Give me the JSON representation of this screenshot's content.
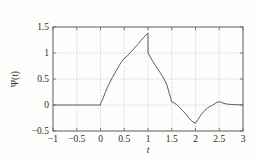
{
  "figure": {
    "background_color": "#fdfdfb",
    "frame_color": "#6b6b6b",
    "grid_color": "#b9b9b9",
    "curve_color": "#4a4a4a",
    "text_color": "#2b2b2b"
  },
  "chart_data": {
    "type": "line",
    "title": "",
    "xlabel": "t",
    "ylabel": "Ψ(t)",
    "xlim": [
      -1,
      3
    ],
    "ylim": [
      -0.5,
      1.5
    ],
    "xticks": [
      -1,
      -0.5,
      0,
      0.5,
      1,
      1.5,
      2,
      2.5,
      3
    ],
    "xticklabels": [
      "−1",
      "−0.5",
      "0",
      "0.5",
      "1",
      "1.5",
      "2",
      "2.5",
      "3"
    ],
    "yticks": [
      -0.5,
      0,
      0.5,
      1,
      1.5
    ],
    "yticklabels": [
      "−0.5",
      "0",
      "0.5",
      "1",
      "1.5"
    ],
    "grid": true,
    "grid_style": "dotted",
    "legend": null,
    "series": [
      {
        "name": "Ψ(t)",
        "color": "#4a4a4a",
        "linewidth": 0.9,
        "x": [
          -1.0,
          -0.9,
          -0.8,
          -0.7,
          -0.6,
          -0.5,
          -0.4,
          -0.3,
          -0.2,
          -0.1,
          0.0,
          0.0,
          0.05,
          0.1,
          0.15,
          0.2,
          0.25,
          0.3,
          0.35,
          0.4,
          0.45,
          0.5,
          0.55,
          0.6,
          0.65,
          0.7,
          0.75,
          0.8,
          0.85,
          0.9,
          0.95,
          1.0,
          1.0,
          1.05,
          1.1,
          1.15,
          1.2,
          1.25,
          1.3,
          1.35,
          1.4,
          1.45,
          1.5,
          1.55,
          1.6,
          1.65,
          1.7,
          1.75,
          1.8,
          1.85,
          1.9,
          1.95,
          2.0,
          2.05,
          2.1,
          2.15,
          2.2,
          2.25,
          2.3,
          2.35,
          2.4,
          2.45,
          2.5,
          2.55,
          2.6,
          2.65,
          2.7,
          2.75,
          2.8,
          2.85,
          2.9,
          2.95,
          3.0
        ],
        "y": [
          0.0,
          0.0,
          0.0,
          0.0,
          0.0,
          0.0,
          0.0,
          0.0,
          0.0,
          0.0,
          0.0,
          0.02,
          0.12,
          0.24,
          0.35,
          0.44,
          0.53,
          0.61,
          0.69,
          0.77,
          0.84,
          0.9,
          0.93,
          0.98,
          1.03,
          1.08,
          1.13,
          1.18,
          1.24,
          1.29,
          1.34,
          1.38,
          1.0,
          0.92,
          0.84,
          0.77,
          0.7,
          0.63,
          0.56,
          0.48,
          0.38,
          0.22,
          0.06,
          0.04,
          0.01,
          -0.03,
          -0.08,
          -0.13,
          -0.18,
          -0.24,
          -0.29,
          -0.33,
          -0.35,
          -0.28,
          -0.21,
          -0.15,
          -0.1,
          -0.06,
          -0.03,
          -0.01,
          0.02,
          0.05,
          0.06,
          0.05,
          0.03,
          0.02,
          0.015,
          0.01,
          0.008,
          0.006,
          0.005,
          0.004,
          0.003
        ]
      }
    ],
    "annotations": [
      {
        "label": "peak",
        "x": 1.0,
        "y": 1.38
      },
      {
        "label": "discontinuity-drop",
        "x": 1.0,
        "y": 1.0
      },
      {
        "label": "minimum",
        "x": 2.0,
        "y": -0.35
      },
      {
        "label": "secondary-bump",
        "x": 2.45,
        "y": 0.06
      }
    ]
  }
}
